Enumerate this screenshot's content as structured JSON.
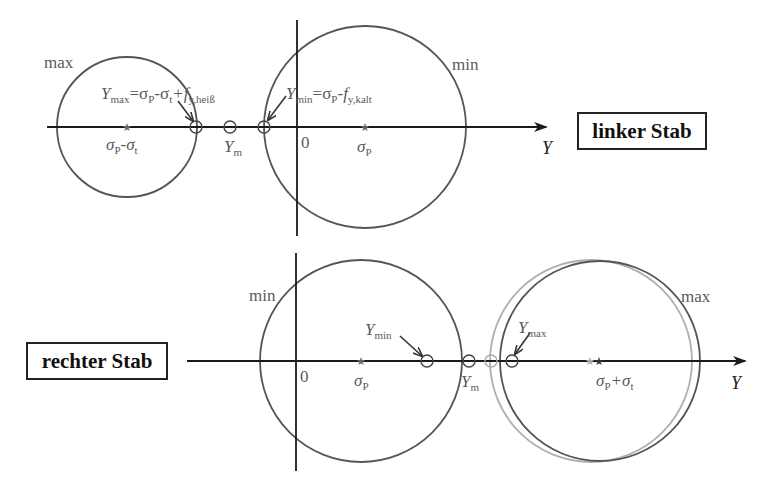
{
  "panels": {
    "left_bar": {
      "title": "linker Stab",
      "axis_label": "Y",
      "origin_label": "0",
      "circle_max_label": "max",
      "circle_min_label": "min",
      "center_max_label_a": "σ",
      "center_max_label_a_sub": "P",
      "center_max_label_b": "-σ",
      "center_max_label_b_sub": "t",
      "center_min_label": "σ",
      "center_min_label_sub": "P",
      "ym_label": "Y",
      "ym_label_sub": "m",
      "ymax_eq": {
        "y": "Y",
        "y_sub": "max",
        "eq": "=σ",
        "p_sub": "P",
        "minus_sigma": "-σ",
        "t_sub": "t",
        "plus_f": "+f",
        "f_sub": "y,heiß"
      },
      "ymin_eq": {
        "y": "Y",
        "y_sub": "min",
        "eq": "=σ",
        "p_sub": "P",
        "minus_f": "-f",
        "f_sub": "y,kalt"
      }
    },
    "right_bar": {
      "title": "rechter Stab",
      "axis_label": "Y",
      "origin_label": "0",
      "circle_min_label": "min",
      "circle_max_label": "max",
      "center_min_label": "σ",
      "center_min_label_sub": "P",
      "center_max_label_a": "σ",
      "center_max_label_a_sub": "P",
      "center_max_label_b": "+σ",
      "center_max_label_b_sub": "t",
      "ymin_label": "Y",
      "ymin_label_sub": "min",
      "ym_label": "Y",
      "ym_label_sub": "m",
      "ymax_label": "Y",
      "ymax_label_sub": "max"
    }
  },
  "colors": {
    "axis": "#1a1a1a",
    "circle_dark": "#555555",
    "circle_light": "#b0b0b0",
    "label_gray": "#5a5a5a",
    "box_border": "#222222"
  }
}
